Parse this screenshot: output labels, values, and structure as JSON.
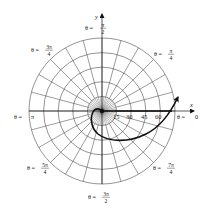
{
  "diagram": {
    "type": "polar-coordinate-grid-with-spiral-path",
    "center_px": [
      102,
      111
    ],
    "ring_spacing_px": 14.6,
    "ring_count": 5,
    "outer_spoke_step_deg": 15,
    "inner_spoke_step_deg": 7.5,
    "axes": {
      "x_label": "x",
      "y_label": "y"
    },
    "radial_tick_labels": [
      "15",
      "30",
      "45",
      "60"
    ],
    "angle_labels": [
      {
        "id": "theta-0",
        "prefix": "θ = ",
        "value": "0",
        "fraction": false
      },
      {
        "id": "theta-pi-4",
        "prefix": "θ = ",
        "num": "π",
        "den": "4",
        "fraction": true
      },
      {
        "id": "theta-pi-2",
        "prefix": "θ = ",
        "num": "π",
        "den": "2",
        "fraction": true
      },
      {
        "id": "theta-3pi-4",
        "prefix": "θ = ",
        "num": "3π",
        "den": "4",
        "fraction": true
      },
      {
        "id": "theta-pi",
        "prefix": "θ = ",
        "value": "π",
        "fraction": false
      },
      {
        "id": "theta-5pi-4",
        "prefix": "θ = ",
        "num": "5π",
        "den": "4",
        "fraction": true
      },
      {
        "id": "theta-3pi-2",
        "prefix": "θ = ",
        "num": "3π",
        "den": "2",
        "fraction": true
      },
      {
        "id": "theta-7pi-4",
        "prefix": "θ = ",
        "num": "7π",
        "den": "4",
        "fraction": true
      }
    ],
    "curve": {
      "description": "Spiral path starting at origin, curling around through θ=π and 3π/2, sweeping out past θ=0 with arrowhead",
      "color": "#111111"
    },
    "bold_ray": {
      "description": "Bold ray along θ = 0 from origin to r ≈ 75",
      "color": "#111111"
    }
  }
}
